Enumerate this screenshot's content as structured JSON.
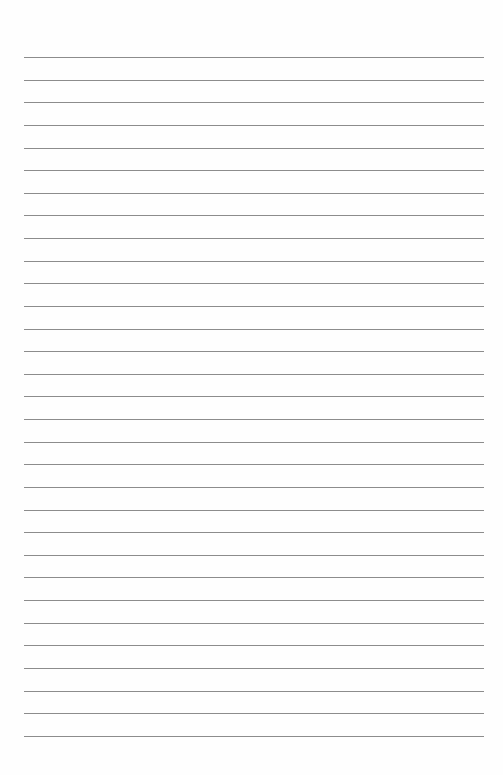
{
  "page": {
    "type": "lined-paper",
    "background_color": "#fefefe",
    "line_color": "#8c8c8c",
    "line_count": 31,
    "first_line_y": 57,
    "line_spacing": 22.63,
    "line_left": 24,
    "line_right": 484,
    "text": ""
  }
}
